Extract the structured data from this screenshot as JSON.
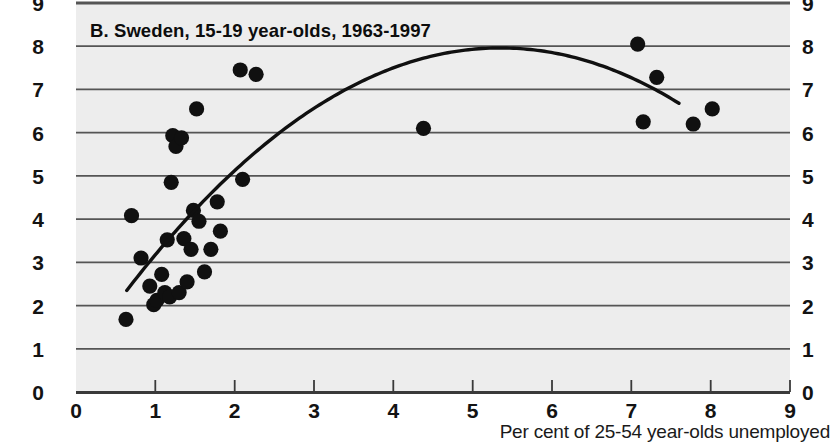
{
  "chart_data": {
    "type": "scatter",
    "title": "B.  Sweden, 15-19 year-olds, 1963-1997",
    "panel_letter": "B.",
    "region": "Sweden",
    "age_group": "15-19 year-olds",
    "period": "1963-1997",
    "xlabel": "Per cent of 25-54 year-olds unemployed",
    "ylabel": "",
    "xlim": [
      0,
      9
    ],
    "ylim": [
      0,
      9
    ],
    "xticks": [
      "0",
      "1",
      "2",
      "3",
      "4",
      "5",
      "6",
      "7",
      "8",
      "9"
    ],
    "yticks_left": [
      "0",
      "1",
      "2",
      "3",
      "4",
      "5",
      "6",
      "7",
      "8",
      "9"
    ],
    "yticks_right": [
      "0",
      "1",
      "2",
      "3",
      "4",
      "5",
      "6",
      "7",
      "8",
      "9"
    ],
    "grid": "horizontal",
    "legend": "none",
    "marker": "filled-circle",
    "marker_color": "#101010",
    "plot_bg": "#ededed",
    "grid_color": "#555555",
    "axis_color": "#333333",
    "curve_color": "#101010",
    "points": [
      {
        "x": 0.63,
        "y": 1.68
      },
      {
        "x": 0.7,
        "y": 4.08
      },
      {
        "x": 0.82,
        "y": 3.1
      },
      {
        "x": 0.93,
        "y": 2.45
      },
      {
        "x": 0.98,
        "y": 2.02
      },
      {
        "x": 1.02,
        "y": 2.12
      },
      {
        "x": 1.08,
        "y": 2.72
      },
      {
        "x": 1.12,
        "y": 2.3
      },
      {
        "x": 1.15,
        "y": 3.52
      },
      {
        "x": 1.18,
        "y": 2.2
      },
      {
        "x": 1.2,
        "y": 4.85
      },
      {
        "x": 1.22,
        "y": 5.93
      },
      {
        "x": 1.26,
        "y": 5.68
      },
      {
        "x": 1.3,
        "y": 2.3
      },
      {
        "x": 1.33,
        "y": 5.88
      },
      {
        "x": 1.36,
        "y": 3.55
      },
      {
        "x": 1.4,
        "y": 2.55
      },
      {
        "x": 1.45,
        "y": 3.3
      },
      {
        "x": 1.48,
        "y": 4.2
      },
      {
        "x": 1.52,
        "y": 6.55
      },
      {
        "x": 1.55,
        "y": 3.95
      },
      {
        "x": 1.62,
        "y": 2.78
      },
      {
        "x": 1.7,
        "y": 3.3
      },
      {
        "x": 1.78,
        "y": 4.4
      },
      {
        "x": 1.82,
        "y": 3.72
      },
      {
        "x": 2.07,
        "y": 7.45
      },
      {
        "x": 2.1,
        "y": 4.92
      },
      {
        "x": 2.27,
        "y": 7.35
      },
      {
        "x": 4.38,
        "y": 6.1
      },
      {
        "x": 7.08,
        "y": 8.05
      },
      {
        "x": 7.15,
        "y": 6.25
      },
      {
        "x": 7.32,
        "y": 7.28
      },
      {
        "x": 7.78,
        "y": 6.2
      },
      {
        "x": 8.02,
        "y": 6.55
      }
    ],
    "fit_curve": {
      "label": "quadratic fit",
      "x_start": 0.64,
      "x_end": 7.6,
      "vertex_x": 5.35,
      "vertex_y": 7.96,
      "y_start": 2.35,
      "y_end": 6.3
    }
  }
}
